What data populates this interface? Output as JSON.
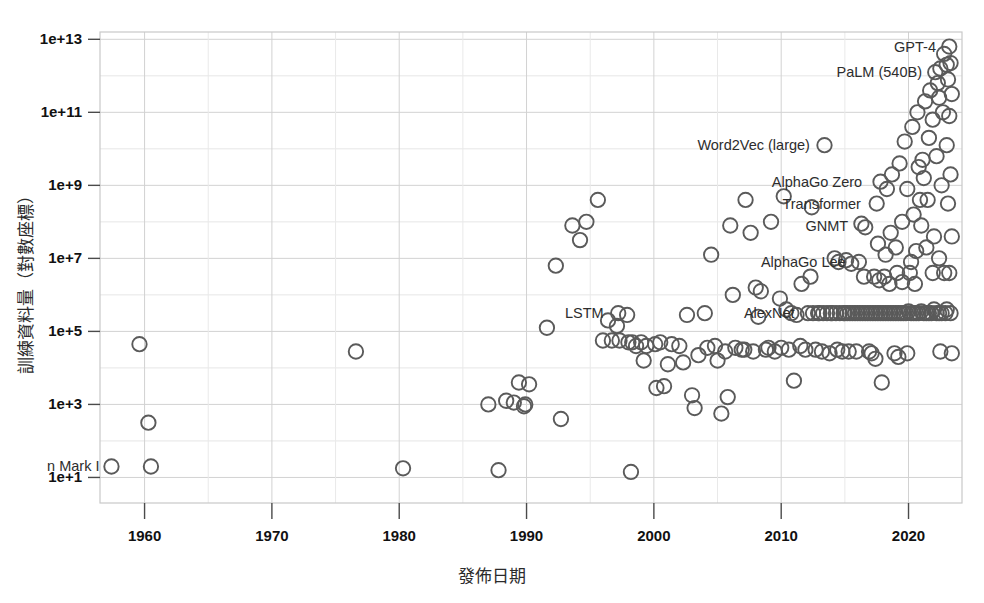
{
  "chart_data": {
    "type": "scatter",
    "title": "",
    "xlabel": "發佈日期",
    "ylabel": "訓練資料量（對數座標）",
    "xlim": [
      1956.5,
      2024.2
    ],
    "ylim_log10": [
      0.3,
      13.2
    ],
    "yscale": "log",
    "grid": true,
    "legend": "none",
    "xticks": [
      1960,
      1970,
      1980,
      1990,
      2000,
      2010,
      2020
    ],
    "xtick_labels": [
      "1960",
      "1970",
      "1980",
      "1990",
      "2000",
      "2010",
      "2020"
    ],
    "yticks_log10": [
      1,
      3,
      5,
      7,
      9,
      11,
      13
    ],
    "ytick_labels": [
      "1e+1",
      "1e+3",
      "1e+5",
      "1e+7",
      "1e+9",
      "1e+11",
      "1e+13"
    ],
    "y_gridlines_log10": [
      1,
      2,
      3,
      4,
      5,
      6,
      7,
      8,
      9,
      10,
      11,
      12,
      13
    ],
    "marker": {
      "shape": "open-circle",
      "radius_px": 7.2,
      "stroke": "#5a5a5a",
      "fill": "none",
      "stroke_width": 1.9
    },
    "annotations": [
      {
        "label": "n Mark I",
        "x": 1957.4,
        "y_log10": 1.3,
        "anchor": "end",
        "clipped_left": true
      },
      {
        "label": "LSTM",
        "x": 1997.0,
        "y_log10": 5.5,
        "anchor": "end"
      },
      {
        "label": "AlexNet",
        "x": 2012.0,
        "y_log10": 5.5,
        "anchor": "end"
      },
      {
        "label": "AlphaGo Lee",
        "x": 2016.0,
        "y_log10": 6.9,
        "anchor": "end"
      },
      {
        "label": "GNMT",
        "x": 2016.2,
        "y_log10": 7.9,
        "anchor": "end"
      },
      {
        "label": "Transformer",
        "x": 2017.2,
        "y_log10": 8.5,
        "anchor": "end"
      },
      {
        "label": "AlphaGo Zero",
        "x": 2017.3,
        "y_log10": 9.1,
        "anchor": "end"
      },
      {
        "label": "Word2Vec (large)",
        "x": 2013.2,
        "y_log10": 10.1,
        "anchor": "end"
      },
      {
        "label": "PaLM (540B)",
        "x": 2022.0,
        "y_log10": 12.1,
        "anchor": "end"
      },
      {
        "label": "GPT-4",
        "x": 2023.1,
        "y_log10": 12.8,
        "anchor": "end"
      }
    ],
    "points": [
      [
        1957.4,
        1.3
      ],
      [
        1960.5,
        1.3
      ],
      [
        1960.3,
        2.5
      ],
      [
        1959.6,
        4.65
      ],
      [
        1976.6,
        4.45
      ],
      [
        1980.3,
        1.25
      ],
      [
        1987.0,
        3.0
      ],
      [
        1987.8,
        1.2
      ],
      [
        1988.4,
        3.1
      ],
      [
        1989.0,
        3.05
      ],
      [
        1989.9,
        3.0
      ],
      [
        1989.4,
        3.6
      ],
      [
        1989.8,
        2.95
      ],
      [
        1990.2,
        3.55
      ],
      [
        1991.6,
        5.1
      ],
      [
        1992.3,
        6.8
      ],
      [
        1992.7,
        2.6
      ],
      [
        1993.6,
        7.9
      ],
      [
        1994.2,
        7.5
      ],
      [
        1994.7,
        8.0
      ],
      [
        1995.6,
        8.6
      ],
      [
        1996.4,
        5.3
      ],
      [
        1996.0,
        4.75
      ],
      [
        1996.7,
        4.75
      ],
      [
        1997.2,
        5.5
      ],
      [
        1997.1,
        5.15
      ],
      [
        1997.9,
        5.45
      ],
      [
        1997.3,
        4.75
      ],
      [
        1998.0,
        4.7
      ],
      [
        1998.3,
        4.7
      ],
      [
        1998.6,
        4.6
      ],
      [
        1998.2,
        1.15
      ],
      [
        1999.0,
        4.7
      ],
      [
        1999.4,
        4.6
      ],
      [
        1999.2,
        4.2
      ],
      [
        2000.1,
        4.65
      ],
      [
        2000.5,
        4.7
      ],
      [
        2000.8,
        3.5
      ],
      [
        2001.1,
        4.1
      ],
      [
        2001.4,
        4.65
      ],
      [
        2002.0,
        4.6
      ],
      [
        2002.6,
        5.45
      ],
      [
        2003.0,
        3.25
      ],
      [
        2003.5,
        4.35
      ],
      [
        2003.2,
        2.9
      ],
      [
        2004.0,
        5.5
      ],
      [
        2004.5,
        7.1
      ],
      [
        2004.8,
        4.6
      ],
      [
        2005.0,
        4.2
      ],
      [
        2005.6,
        4.45
      ],
      [
        2005.3,
        2.75
      ],
      [
        2006.0,
        7.9
      ],
      [
        2006.4,
        4.55
      ],
      [
        2006.9,
        4.5
      ],
      [
        2007.2,
        8.6
      ],
      [
        2007.6,
        7.7
      ],
      [
        2007.1,
        4.5
      ],
      [
        2008.0,
        6.2
      ],
      [
        2008.4,
        6.1
      ],
      [
        2008.8,
        4.5
      ],
      [
        2009.0,
        4.55
      ],
      [
        2009.5,
        4.45
      ],
      [
        2009.9,
        5.9
      ],
      [
        2010.0,
        4.55
      ],
      [
        2010.4,
        5.6
      ],
      [
        2010.8,
        5.5
      ],
      [
        2011.0,
        3.65
      ],
      [
        2011.5,
        4.6
      ],
      [
        2011.9,
        4.5
      ],
      [
        2012.1,
        5.5
      ],
      [
        2012.5,
        5.5
      ],
      [
        2012.9,
        5.5
      ],
      [
        2012.3,
        6.5
      ],
      [
        2012.7,
        4.5
      ],
      [
        2013.0,
        5.5
      ],
      [
        2013.3,
        5.5
      ],
      [
        2013.4,
        10.1
      ],
      [
        2013.6,
        5.5
      ],
      [
        2013.9,
        5.5
      ],
      [
        2013.2,
        4.45
      ],
      [
        2014.0,
        5.5
      ],
      [
        2014.3,
        5.5
      ],
      [
        2014.6,
        5.5
      ],
      [
        2014.9,
        5.5
      ],
      [
        2014.2,
        7.0
      ],
      [
        2014.5,
        6.9
      ],
      [
        2014.8,
        4.45
      ],
      [
        2015.0,
        5.5
      ],
      [
        2015.2,
        5.5
      ],
      [
        2015.4,
        5.5
      ],
      [
        2015.6,
        5.5
      ],
      [
        2015.8,
        5.5
      ],
      [
        2015.1,
        6.95
      ],
      [
        2015.5,
        6.85
      ],
      [
        2015.9,
        4.45
      ],
      [
        2016.0,
        5.5
      ],
      [
        2016.2,
        5.5
      ],
      [
        2016.4,
        5.5
      ],
      [
        2016.6,
        5.5
      ],
      [
        2016.8,
        5.5
      ],
      [
        2016.3,
        7.95
      ],
      [
        2016.6,
        7.85
      ],
      [
        2016.1,
        6.9
      ],
      [
        2016.5,
        6.5
      ],
      [
        2016.9,
        4.45
      ],
      [
        2017.0,
        5.5
      ],
      [
        2017.2,
        5.5
      ],
      [
        2017.4,
        5.5
      ],
      [
        2017.6,
        5.5
      ],
      [
        2017.8,
        5.5
      ],
      [
        2017.5,
        8.5
      ],
      [
        2017.8,
        9.1
      ],
      [
        2017.3,
        6.5
      ],
      [
        2017.7,
        6.4
      ],
      [
        2017.1,
        4.4
      ],
      [
        2017.9,
        3.6
      ],
      [
        2018.0,
        5.5
      ],
      [
        2018.2,
        5.5
      ],
      [
        2018.4,
        5.5
      ],
      [
        2018.6,
        5.5
      ],
      [
        2018.8,
        5.5
      ],
      [
        2018.3,
        8.9
      ],
      [
        2018.7,
        9.3
      ],
      [
        2018.1,
        6.5
      ],
      [
        2018.5,
        6.3
      ],
      [
        2018.9,
        4.4
      ],
      [
        2019.0,
        5.5
      ],
      [
        2019.2,
        5.5
      ],
      [
        2019.4,
        5.5
      ],
      [
        2019.6,
        5.5
      ],
      [
        2019.8,
        5.5
      ],
      [
        2019.3,
        9.6
      ],
      [
        2019.7,
        10.2
      ],
      [
        2019.1,
        6.6
      ],
      [
        2019.5,
        6.35
      ],
      [
        2019.9,
        4.4
      ],
      [
        2020.0,
        5.55
      ],
      [
        2020.2,
        5.5
      ],
      [
        2020.4,
        5.5
      ],
      [
        2020.6,
        5.5
      ],
      [
        2020.8,
        5.5
      ],
      [
        2020.3,
        10.6
      ],
      [
        2020.7,
        11.0
      ],
      [
        2020.1,
        6.6
      ],
      [
        2020.5,
        6.3
      ],
      [
        2020.9,
        8.6
      ],
      [
        2021.0,
        5.55
      ],
      [
        2021.2,
        5.5
      ],
      [
        2021.4,
        5.5
      ],
      [
        2021.6,
        5.5
      ],
      [
        2021.8,
        5.5
      ],
      [
        2021.3,
        11.3
      ],
      [
        2021.7,
        11.6
      ],
      [
        2021.1,
        9.7
      ],
      [
        2021.5,
        8.6
      ],
      [
        2021.9,
        6.6
      ],
      [
        2022.0,
        5.6
      ],
      [
        2022.2,
        5.5
      ],
      [
        2022.4,
        5.5
      ],
      [
        2022.6,
        5.5
      ],
      [
        2022.1,
        12.1
      ],
      [
        2022.5,
        12.2
      ],
      [
        2022.3,
        11.8
      ],
      [
        2022.7,
        11.0
      ],
      [
        2022.2,
        9.8
      ],
      [
        2022.6,
        9.0
      ],
      [
        2022.8,
        6.6
      ],
      [
        2022.9,
        5.5
      ],
      [
        2023.0,
        12.3
      ],
      [
        2023.2,
        12.8
      ],
      [
        2023.3,
        12.35
      ],
      [
        2023.1,
        11.9
      ],
      [
        2023.4,
        11.5
      ],
      [
        2023.2,
        10.9
      ],
      [
        2023.0,
        10.1
      ],
      [
        2023.3,
        9.3
      ],
      [
        2023.1,
        8.5
      ],
      [
        2023.4,
        7.6
      ],
      [
        2023.2,
        6.6
      ],
      [
        2023.0,
        5.6
      ],
      [
        2023.3,
        5.5
      ],
      [
        2022.8,
        12.6
      ],
      [
        2022.4,
        11.4
      ],
      [
        2021.9,
        10.8
      ],
      [
        2021.6,
        10.3
      ],
      [
        2021.2,
        9.2
      ],
      [
        2020.8,
        9.5
      ],
      [
        2020.4,
        8.2
      ],
      [
        2019.9,
        8.9
      ],
      [
        2019.5,
        8.0
      ],
      [
        2019.0,
        7.3
      ],
      [
        2018.6,
        7.7
      ],
      [
        2018.2,
        7.1
      ],
      [
        2017.6,
        7.4
      ],
      [
        2021.0,
        7.9
      ],
      [
        2021.4,
        7.3
      ],
      [
        2022.0,
        7.6
      ],
      [
        2022.4,
        7.0
      ],
      [
        2020.6,
        7.2
      ],
      [
        2020.2,
        6.9
      ],
      [
        2009.2,
        8.0
      ],
      [
        2010.2,
        8.7
      ],
      [
        2011.6,
        6.3
      ],
      [
        2012.4,
        8.4
      ],
      [
        2006.2,
        6.0
      ],
      [
        2008.2,
        5.4
      ],
      [
        2014.4,
        4.5
      ],
      [
        2015.3,
        4.45
      ],
      [
        2019.2,
        4.3
      ],
      [
        2017.4,
        4.25
      ],
      [
        2011.2,
        5.45
      ],
      [
        2010.6,
        4.5
      ],
      [
        2013.8,
        4.4
      ],
      [
        2007.8,
        4.45
      ],
      [
        2004.2,
        4.55
      ],
      [
        2002.3,
        4.15
      ],
      [
        2000.2,
        3.45
      ],
      [
        2005.8,
        3.2
      ],
      [
        2023.4,
        4.4
      ],
      [
        2022.5,
        4.45
      ]
    ]
  }
}
